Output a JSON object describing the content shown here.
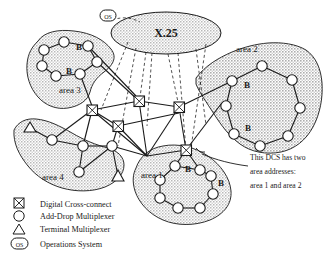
{
  "diagram": {
    "clouds": [
      {
        "id": "x25",
        "label": "X.25",
        "shape": "ellipse"
      }
    ],
    "areas": [
      {
        "id": "area-3",
        "label": "area 3",
        "node_labels": [
          "B",
          "B"
        ]
      },
      {
        "id": "area-2",
        "label": "area 2",
        "node_labels": [
          "B",
          "B"
        ]
      },
      {
        "id": "area-1",
        "label": "area 1",
        "node_labels": [
          "B",
          "B"
        ]
      },
      {
        "id": "area-4",
        "label": "area 4",
        "node_labels": []
      }
    ],
    "os_node": {
      "label": "OS"
    },
    "annotation": {
      "line1": "This DCS has two",
      "line2": "area addresses:",
      "line3": "area 1 and area 2"
    },
    "node_letters": {
      "a3_top": "B",
      "a3_bottom": "B",
      "a2_left": "B",
      "a2_lower": "B",
      "a1_right": "B",
      "a1_far": "B"
    }
  },
  "legend": {
    "items": [
      {
        "icon": "cross-connect-icon",
        "label": "Digital Cross-connect"
      },
      {
        "icon": "circle-icon",
        "label": "Add-Drop Multiplexer"
      },
      {
        "icon": "triangle-icon",
        "label": "Terminal Multiplexer"
      },
      {
        "icon": "os-icon",
        "label": "Operations System",
        "icon_text": "OS"
      }
    ]
  },
  "colors": {
    "ink": "#1a1a1a",
    "shade": "#c9c9c9",
    "shade_light": "#d8d8d8",
    "paper": "#ffffff"
  }
}
